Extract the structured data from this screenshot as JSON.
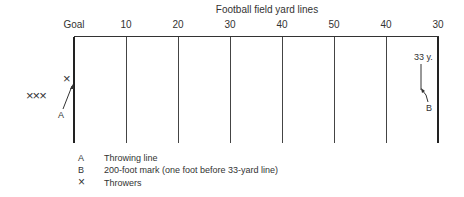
{
  "diagram": {
    "title": "Football field yard lines",
    "yard_lines": [
      {
        "label": "Goal",
        "x": 74
      },
      {
        "label": "10",
        "x": 126
      },
      {
        "label": "20",
        "x": 178
      },
      {
        "label": "30",
        "x": 230
      },
      {
        "label": "40",
        "x": 282
      },
      {
        "label": "50",
        "x": 334
      },
      {
        "label": "40",
        "x": 386
      },
      {
        "label": "30",
        "x": 438
      }
    ],
    "marker_33y": "33 y.",
    "label_a": "A",
    "label_b": "B",
    "throwers_row": "×××",
    "thrower_single": "×"
  },
  "legend": [
    {
      "key": "A",
      "text": "Throwing line"
    },
    {
      "key": "B",
      "text": "200-foot mark (one foot before 33-yard line)"
    },
    {
      "key": "×",
      "text": "Throwers"
    }
  ]
}
